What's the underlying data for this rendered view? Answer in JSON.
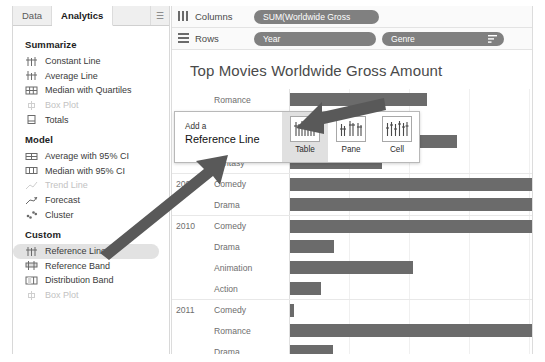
{
  "sidebar": {
    "tabs": [
      {
        "label": "Data",
        "active": false
      },
      {
        "label": "Analytics",
        "active": true
      }
    ],
    "pin_glyph": "☰",
    "sections": [
      {
        "title": "Summarize",
        "items": [
          {
            "label": "Constant Line",
            "icon": "constant-line-icon",
            "disabled": false,
            "selected": false
          },
          {
            "label": "Average Line",
            "icon": "average-line-icon",
            "disabled": false,
            "selected": false
          },
          {
            "label": "Median with Quartiles",
            "icon": "median-quartiles-icon",
            "disabled": false,
            "selected": false
          },
          {
            "label": "Box Plot",
            "icon": "box-plot-icon",
            "disabled": true,
            "selected": false
          },
          {
            "label": "Totals",
            "icon": "totals-icon",
            "disabled": false,
            "selected": false
          }
        ]
      },
      {
        "title": "Model",
        "items": [
          {
            "label": "Average with 95% CI",
            "icon": "average-ci-icon",
            "disabled": false,
            "selected": false
          },
          {
            "label": "Median with 95% CI",
            "icon": "median-ci-icon",
            "disabled": false,
            "selected": false
          },
          {
            "label": "Trend Line",
            "icon": "trend-line-icon",
            "disabled": true,
            "selected": false
          },
          {
            "label": "Forecast",
            "icon": "forecast-icon",
            "disabled": false,
            "selected": false
          },
          {
            "label": "Cluster",
            "icon": "cluster-icon",
            "disabled": false,
            "selected": false
          }
        ]
      },
      {
        "title": "Custom",
        "items": [
          {
            "label": "Reference Line",
            "icon": "reference-line-icon",
            "disabled": false,
            "selected": true
          },
          {
            "label": "Reference Band",
            "icon": "reference-band-icon",
            "disabled": false,
            "selected": false
          },
          {
            "label": "Distribution Band",
            "icon": "distribution-band-icon",
            "disabled": false,
            "selected": false
          },
          {
            "label": "Box Plot",
            "icon": "box-plot-icon",
            "disabled": true,
            "selected": false
          }
        ]
      }
    ]
  },
  "shelves": {
    "columns": {
      "label": "Columns",
      "icon": "columns-icon",
      "pills": [
        {
          "label": "SUM(Worldwide Gross"
        }
      ]
    },
    "rows": {
      "label": "Rows",
      "icon": "rows-icon",
      "pills": [
        {
          "label": "Year",
          "sorted": false
        },
        {
          "label": "Genre",
          "sorted": true
        }
      ]
    }
  },
  "popup": {
    "line1": "Add a",
    "line2": "Reference Line",
    "options": [
      {
        "label": "Table",
        "active": true,
        "icon": "scope-table-icon"
      },
      {
        "label": "Pane",
        "active": false,
        "icon": "scope-pane-icon"
      },
      {
        "label": "Cell",
        "active": false,
        "icon": "scope-cell-icon"
      }
    ]
  },
  "chart_data": {
    "type": "bar",
    "title": "Top Movies Worldwide Gross Amount",
    "xlabel": "",
    "ylabel": "",
    "orientation": "horizontal",
    "grid": true,
    "axis_max": 245,
    "gridline_values": [
      60,
      120,
      180,
      240
    ],
    "row_groups": [
      {
        "year": "",
        "rows": [
          {
            "genre": "Romance",
            "value": 137
          },
          {
            "genre": "Drama",
            "value": 32
          },
          {
            "genre": "Animation",
            "value": 167
          },
          {
            "genre": "Fantasy",
            "value": 92
          }
        ]
      },
      {
        "year": "2009",
        "rows": [
          {
            "genre": "Comedy",
            "value": 245
          },
          {
            "genre": "Drama",
            "value": 245
          }
        ]
      },
      {
        "year": "2010",
        "rows": [
          {
            "genre": "Comedy",
            "value": 245
          },
          {
            "genre": "Drama",
            "value": 44
          },
          {
            "genre": "Animation",
            "value": 123
          },
          {
            "genre": "Action",
            "value": 31
          }
        ]
      },
      {
        "year": "2011",
        "rows": [
          {
            "genre": "Comedy",
            "value": 4
          },
          {
            "genre": "Romance",
            "value": 245
          },
          {
            "genre": "Drama",
            "value": 43
          }
        ]
      }
    ]
  },
  "colors": {
    "bar": "#6b6b6b",
    "pill": "#808080",
    "selected_item": "#e2e2e2",
    "arrow": "#595959",
    "title_text": "#4a4a4a"
  }
}
